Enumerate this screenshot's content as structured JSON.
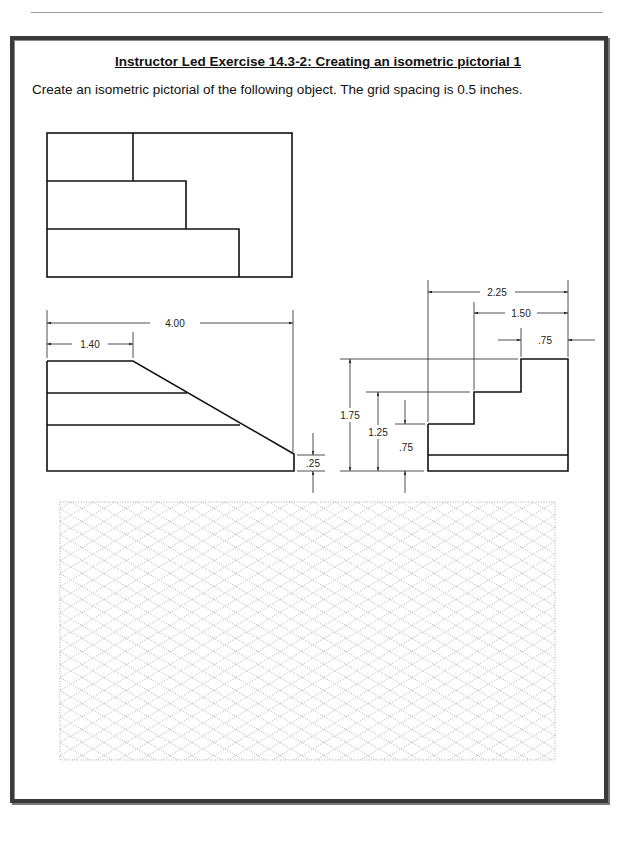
{
  "page": {
    "title": "Instructor Led Exercise 14.3-2:  Creating an isometric pictorial 1",
    "instructions": "Create an isometric pictorial of the following object.  The grid spacing is 0.5 inches."
  },
  "views": {
    "top_view": {
      "label": "top-view"
    },
    "front_view": {
      "dims": {
        "overall_width": "4.00",
        "top_length": "1.40",
        "end_height": ".25"
      }
    },
    "side_view": {
      "dims": {
        "width_total": "2.25",
        "width_mid": "1.50",
        "width_top": ".75",
        "height_total": "1.75",
        "height_mid": "1.25",
        "height_low": ".75"
      }
    }
  },
  "grid": {
    "type": "isometric",
    "spacing": "0.5 inches"
  },
  "colors": {
    "line": "#111111",
    "frame": "#3a3a3a",
    "grid_dot": "#777777"
  }
}
